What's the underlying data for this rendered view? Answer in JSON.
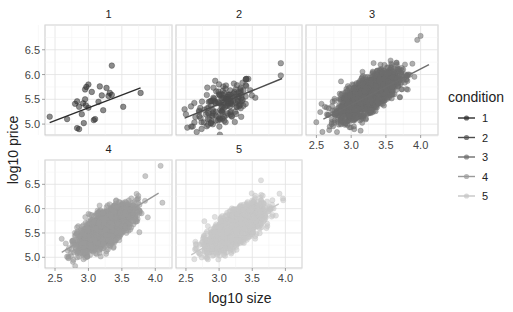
{
  "chart_data": {
    "type": "scatter",
    "title": "",
    "xlabel": "log10 size",
    "ylabel": "log10 price",
    "xlim": [
      2.35,
      4.25
    ],
    "ylim": [
      4.78,
      7.0
    ],
    "x_ticks": [
      2.5,
      3.0,
      3.5,
      4.0
    ],
    "x_tick_labels": [
      "2.5",
      "3.0",
      "3.5",
      "4.0"
    ],
    "y_ticks": [
      5.0,
      5.5,
      6.0,
      6.5
    ],
    "y_tick_labels": [
      "5.0",
      "5.5",
      "6.0",
      "6.5"
    ],
    "grid": true,
    "facet_by": "condition",
    "legend": {
      "title": "condition",
      "position": "right",
      "entries": [
        "1",
        "2",
        "3",
        "4",
        "5"
      ]
    },
    "colors": {
      "1": "#2b2b2b",
      "2": "#4d4d4d",
      "3": "#6e6e6e",
      "4": "#9a9a9a",
      "5": "#c6c6c6"
    },
    "panels": [
      {
        "label": "1",
        "n_points": "small",
        "trend_line": {
          "x": [
            2.42,
            3.78
          ],
          "y": [
            5.03,
            5.73
          ]
        },
        "points": [
          [
            2.42,
            5.15
          ],
          [
            2.68,
            5.1
          ],
          [
            2.83,
            4.92
          ],
          [
            2.86,
            4.9
          ],
          [
            2.8,
            5.41
          ],
          [
            2.83,
            5.46
          ],
          [
            2.86,
            5.35
          ],
          [
            2.9,
            5.2
          ],
          [
            2.92,
            5.42
          ],
          [
            2.93,
            5.02
          ],
          [
            2.95,
            5.5
          ],
          [
            2.95,
            5.7
          ],
          [
            2.97,
            5.75
          ],
          [
            3.0,
            5.8
          ],
          [
            3.0,
            5.33
          ],
          [
            3.05,
            5.65
          ],
          [
            3.08,
            5.08
          ],
          [
            3.1,
            5.1
          ],
          [
            3.15,
            5.45
          ],
          [
            3.17,
            5.76
          ],
          [
            3.2,
            5.58
          ],
          [
            3.22,
            5.28
          ],
          [
            3.27,
            5.73
          ],
          [
            3.3,
            5.57
          ],
          [
            3.32,
            5.63
          ],
          [
            3.35,
            5.59
          ],
          [
            3.35,
            6.18
          ],
          [
            3.52,
            5.35
          ],
          [
            3.78,
            5.63
          ],
          [
            2.96,
            5.38
          ]
        ]
      },
      {
        "label": "2",
        "n_points": "medium",
        "trend_line": {
          "x": [
            2.48,
            3.95
          ],
          "y": [
            5.12,
            5.92
          ]
        },
        "points": []
      },
      {
        "label": "3",
        "n_points": "large",
        "trend_line": {
          "x": [
            2.6,
            4.12
          ],
          "y": [
            5.1,
            6.2
          ]
        },
        "points": []
      },
      {
        "label": "4",
        "n_points": "large",
        "trend_line": {
          "x": [
            2.6,
            4.05
          ],
          "y": [
            5.1,
            6.32
          ]
        },
        "points": []
      },
      {
        "label": "5",
        "n_points": "large",
        "trend_line": {
          "x": [
            2.58,
            3.9
          ],
          "y": [
            5.05,
            6.1
          ]
        },
        "points": []
      }
    ]
  },
  "layout": {
    "strip_labels": [
      "1",
      "2",
      "3",
      "4",
      "5"
    ],
    "x_axis_title": "log10 size",
    "y_axis_title": "log10 price",
    "legend_title": "condition",
    "legend_items": [
      "1",
      "2",
      "3",
      "4",
      "5"
    ]
  }
}
